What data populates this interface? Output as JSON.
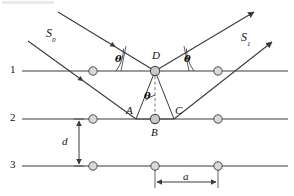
{
  "figure": {
    "type": "physics-ray-diagram",
    "background_color": "#ffffff",
    "line_color": "#3b3b3b",
    "atom_fill": "#d9d9d9",
    "atom_stroke": "#4a4a4a"
  },
  "labels": {
    "incident_beam": "S",
    "incident_beam_sub": "0",
    "diffracted_beam": "S",
    "diffracted_beam_sub": "1",
    "angle_incident": "θ",
    "angle_reflected": "θ",
    "angle_interior": "θ",
    "point_d": "D",
    "point_a": "A",
    "point_b": "B",
    "point_c": "C",
    "plane_1": "1",
    "plane_2": "2",
    "plane_3": "3",
    "interplanar_spacing": "d",
    "atomic_spacing": "a"
  },
  "geometry": {
    "planes": [
      {
        "name": "1",
        "y": 71,
        "x_start": 22,
        "x_end": 288,
        "atoms_x": [
          93,
          155,
          218
        ]
      },
      {
        "name": "2",
        "y": 119,
        "x_start": 22,
        "x_end": 288,
        "atoms_x": [
          93,
          155,
          218
        ]
      },
      {
        "name": "3",
        "y": 166,
        "x_start": 22,
        "x_end": 288,
        "atoms_x": [
          93,
          155,
          218
        ]
      }
    ],
    "scatter_point_D": {
      "x": 155,
      "y": 71
    },
    "scatter_point_B": {
      "x": 155,
      "y": 119
    },
    "foot_A": {
      "x": 136,
      "y": 119
    },
    "foot_C": {
      "x": 174,
      "y": 119
    },
    "dashed_normal": {
      "x": 155,
      "y1": 71,
      "y2": 119
    },
    "d_arrow": {
      "x": 79,
      "y_top": 119,
      "y_bottom": 166
    },
    "a_arrow": {
      "y": 182,
      "x_left": 155,
      "x_right": 218
    }
  },
  "values": {
    "theta_symbol": "θ",
    "planes_count": 3,
    "atoms_per_plane": 3,
    "rays_in": 2,
    "rays_out": 2
  }
}
